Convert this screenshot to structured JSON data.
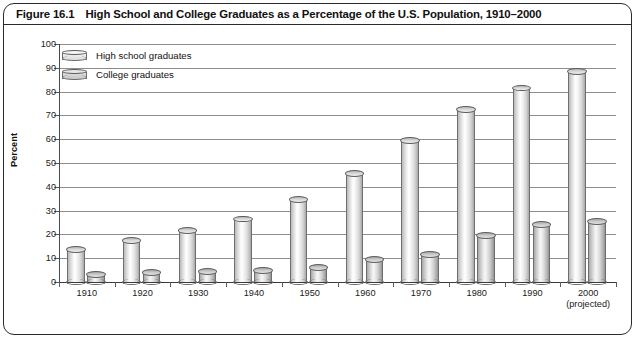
{
  "figure": {
    "number": "Figure 16.1",
    "title": "High School and College Graduates as a Percentage of the U.S. Population, 1910–2000"
  },
  "axis": {
    "ylabel": "Percent",
    "yticks": [
      "100",
      "90",
      "80",
      "70",
      "60",
      "50",
      "40",
      "30",
      "20",
      "10",
      "0"
    ],
    "xlabel": "",
    "projected_note": "(projected)"
  },
  "legend": {
    "position": "top-left",
    "items": [
      {
        "label": "High school graduates",
        "key": "high_school",
        "icon": "cylinder-light-icon"
      },
      {
        "label": "College graduates",
        "key": "college",
        "icon": "cylinder-dark-icon"
      }
    ]
  },
  "chart_data": {
    "type": "bar",
    "title": "High School and College Graduates as a Percentage of the U.S. Population, 1910–2000",
    "xlabel": "",
    "ylabel": "Percent",
    "ylim": [
      0,
      100
    ],
    "ytick_step": 10,
    "grid": true,
    "legend_position": "top-left",
    "categories": [
      "1910",
      "1920",
      "1930",
      "1940",
      "1950",
      "1960",
      "1970",
      "1980",
      "1990",
      "2000"
    ],
    "category_notes": {
      "2000": "(projected)"
    },
    "series": [
      {
        "name": "High school graduates",
        "values": [
          13.5,
          17.5,
          21.5,
          26.5,
          34.5,
          45.5,
          59.5,
          72.5,
          81.5,
          88.5
        ]
      },
      {
        "name": "College graduates",
        "values": [
          3,
          4,
          4.5,
          5,
          6,
          9.5,
          11.5,
          19.5,
          24,
          25.5
        ]
      }
    ]
  },
  "colors": {
    "frame": "#2a2a2a",
    "grid": "#8d8d8d",
    "text": "#111111",
    "high_school_bar": "#ededed",
    "college_bar": "#dedede"
  }
}
